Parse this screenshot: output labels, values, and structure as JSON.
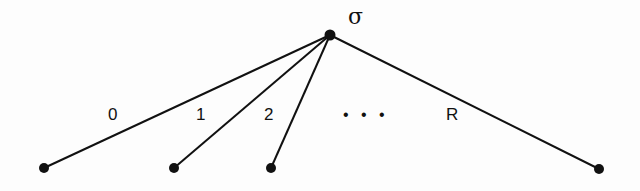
{
  "diagram": {
    "type": "tree",
    "root": {
      "label": "σ",
      "x": 330,
      "y": 35
    },
    "leaves": [
      {
        "id": "leaf-0",
        "x": 44,
        "y": 168
      },
      {
        "id": "leaf-1",
        "x": 174,
        "y": 168
      },
      {
        "id": "leaf-2",
        "x": 271,
        "y": 168
      },
      {
        "id": "leaf-R",
        "x": 599,
        "y": 169
      }
    ],
    "edge_labels": [
      "0",
      "1",
      "2",
      "R"
    ],
    "ellipsis": "• • •",
    "colors": {
      "line": "#111111",
      "node": "#111111",
      "background": "#fdfdfd"
    }
  }
}
